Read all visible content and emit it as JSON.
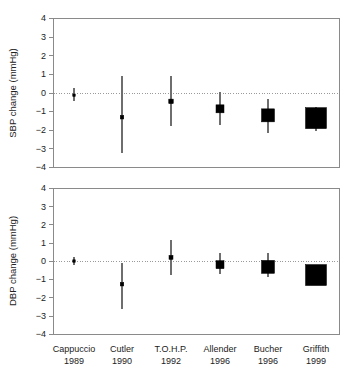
{
  "chart_data": [
    {
      "type": "scatter",
      "panel": "top",
      "title": "",
      "xlabel": "",
      "ylabel": "SBP change (mmHg)",
      "ylim": [
        -4,
        4
      ],
      "yticks": [
        4,
        3,
        2,
        1,
        0,
        -1,
        -2,
        -3,
        -4
      ],
      "ytick_labels": [
        "4",
        "3",
        "2",
        "1",
        "0",
        "−1",
        "−2",
        "−3",
        "−4"
      ],
      "grid": false,
      "zero_reference_line": 0,
      "categories": [
        "Cappuccio 1989",
        "Cutler 1990",
        "T.O.H.P. 1992",
        "Allender 1996",
        "Bucher 1996",
        "Griffith 1999"
      ],
      "points": [
        {
          "label": "Cappuccio 1989",
          "value": -0.12,
          "ci_low": -0.45,
          "ci_high": 0.25,
          "marker_size": 2.5
        },
        {
          "label": "Cutler 1990",
          "value": -1.3,
          "ci_low": -3.2,
          "ci_high": 0.9,
          "marker_size": 3.5
        },
        {
          "label": "T.O.H.P. 1992",
          "value": -0.45,
          "ci_low": -1.75,
          "ci_high": 0.92,
          "marker_size": 4.5
        },
        {
          "label": "Allender 1996",
          "value": -0.85,
          "ci_low": -1.7,
          "ci_high": 0.05,
          "marker_size": 8
        },
        {
          "label": "Bucher 1996",
          "value": -1.2,
          "ci_low": -2.15,
          "ci_high": -0.3,
          "marker_size": 13
        },
        {
          "label": "Griffith 1999",
          "value": -1.35,
          "ci_low": -2.05,
          "ci_high": -0.75,
          "marker_size": 21
        }
      ]
    },
    {
      "type": "scatter",
      "panel": "bottom",
      "title": "",
      "xlabel": "",
      "ylabel": "DBP change (mmHg)",
      "ylim": [
        -4,
        4
      ],
      "yticks": [
        4,
        3,
        2,
        1,
        0,
        -1,
        -2,
        -3,
        -4
      ],
      "ytick_labels": [
        "4",
        "3",
        "2",
        "1",
        "0",
        "−1",
        "−2",
        "−3",
        "−4"
      ],
      "grid": false,
      "zero_reference_line": 0,
      "categories": [
        "Cappuccio 1989",
        "Cutler 1990",
        "T.O.H.P. 1992",
        "Allender 1996",
        "Bucher 1996",
        "Griffith 1999"
      ],
      "points": [
        {
          "label": "Cappuccio 1989",
          "value": 0.02,
          "ci_low": -0.2,
          "ci_high": 0.25,
          "marker_size": 2.5
        },
        {
          "label": "Cutler 1990",
          "value": -1.25,
          "ci_low": -2.6,
          "ci_high": -0.1,
          "marker_size": 3.5
        },
        {
          "label": "T.O.H.P. 1992",
          "value": 0.22,
          "ci_low": -0.75,
          "ci_high": 1.15,
          "marker_size": 4
        },
        {
          "label": "Allender 1996",
          "value": -0.18,
          "ci_low": -0.7,
          "ci_high": 0.45,
          "marker_size": 8
        },
        {
          "label": "Bucher 1996",
          "value": -0.3,
          "ci_low": -0.85,
          "ci_high": 0.45,
          "marker_size": 13
        },
        {
          "label": "Griffith 1999",
          "value": -0.75,
          "ci_low": -1.3,
          "ci_high": -0.2,
          "marker_size": 21
        }
      ]
    }
  ],
  "axis": {
    "y_top_title": "SBP change (mmHg)",
    "y_bottom_title": "DBP change (mmHg)",
    "tick_4": "4",
    "tick_3": "3",
    "tick_2": "2",
    "tick_1": "1",
    "tick_0": "0",
    "tick_n1": "−1",
    "tick_n2": "−2",
    "tick_n3": "−3",
    "tick_n4": "−4"
  },
  "categories": [
    {
      "name": "Cappuccio",
      "year": "1989"
    },
    {
      "name": "Cutler",
      "year": "1990"
    },
    {
      "name": "T.O.H.P.",
      "year": "1992"
    },
    {
      "name": "Allender",
      "year": "1996"
    },
    {
      "name": "Bucher",
      "year": "1996"
    },
    {
      "name": "Griffith",
      "year": "1999"
    }
  ],
  "colors": {
    "marker": "#000000",
    "ci": "#6e6e6e",
    "axis": "#8a8a8a",
    "zero": "#9a9a9a",
    "background": "#ffffff"
  }
}
